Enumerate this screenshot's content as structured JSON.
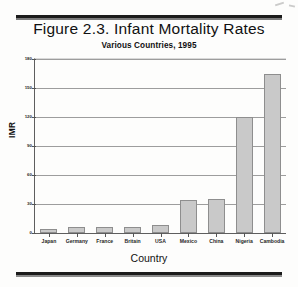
{
  "figure": {
    "title": "Figure 2.3.  Infant Mortality Rates",
    "subtitle": "Various Countries, 1995"
  },
  "chart_data": {
    "type": "bar",
    "title": "Figure 2.3.  Infant Mortality Rates",
    "subtitle": "Various Countries, 1995",
    "xlabel": "Country",
    "ylabel": "IMR",
    "categories": [
      "Japan",
      "Germany",
      "France",
      "Britain",
      "USA",
      "Mexico",
      "China",
      "Nigeria",
      "Cambodia"
    ],
    "values": [
      4,
      6,
      6,
      6,
      8,
      34,
      35,
      120,
      164
    ],
    "series": [
      {
        "name": "IMR",
        "values": [
          4,
          6,
          6,
          6,
          8,
          34,
          35,
          120,
          164
        ]
      }
    ],
    "ylim": [
      0,
      180
    ],
    "yticks": [
      0,
      30,
      60,
      90,
      120,
      150,
      180
    ],
    "ytick_labels": [
      "0",
      "30",
      "60",
      "90",
      "120",
      "150",
      "180"
    ],
    "grid": true,
    "legend": false,
    "bar_color": "#c9c9c9",
    "bar_edge_color": "#8e8e8e"
  }
}
